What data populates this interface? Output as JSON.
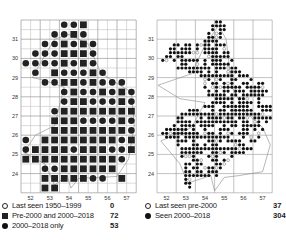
{
  "left_map": {
    "y_ticks": [
      "31",
      "30",
      "29",
      "28",
      "27",
      "26",
      "25",
      "24"
    ],
    "x_ticks": [
      "52",
      "53",
      "54",
      "55",
      "56",
      "57"
    ],
    "legend": [
      {
        "symbol": "open-circle",
        "label": "Last seen 1950–1999",
        "count": "0"
      },
      {
        "symbol": "filled-square",
        "label": "Pre-2000 and 2000–2018",
        "count": "72"
      },
      {
        "symbol": "filled-circle",
        "label": "2000–2018 only",
        "count": "53"
      }
    ],
    "cells": [
      "....ccs.....",
      "...ccsc.....",
      "..ccscsc....",
      ".cccsssc....",
      "ccccscsc....",
      ".c.scccsc...",
      "..ccsscsccc.",
      "....csccscsc",
      "....csscccsc",
      "...cssssssss",
      "...sssccccsc",
      "...ssssssssc",
      "c.sssssssscs",
      "csssscsssccs",
      "ssssssssssc.",
      "..ccssssss..",
      "..ssssscc s.",
      "..ss........"
    ]
  },
  "right_map": {
    "y_ticks": [
      "31",
      "30",
      "29",
      "28",
      "27",
      "26",
      "25",
      "24"
    ],
    "x_ticks": [
      "52",
      "53",
      "54",
      "55",
      "56",
      "57"
    ],
    "legend": [
      {
        "symbol": "open-circle",
        "label": "Last seen pre-2000",
        "count": "37"
      },
      {
        "symbol": "filled-circle",
        "label": "Seen 2000–2018",
        "count": "304"
      }
    ]
  },
  "colors": {
    "grid": "#b8b8b8",
    "symbol": "#222222",
    "outline": "#888888"
  }
}
